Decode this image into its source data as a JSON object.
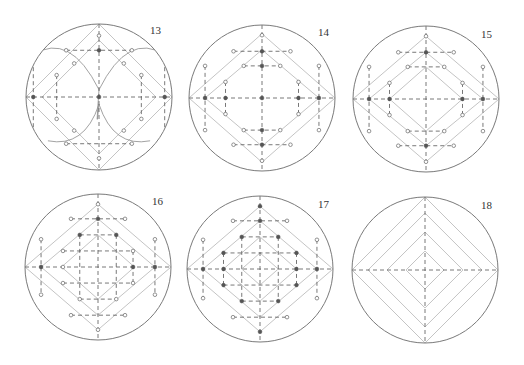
{
  "figure": {
    "width": 524,
    "height": 365,
    "colors": {
      "circle": "#7a7a7a",
      "dashed": "#555555",
      "diamond": "#c4c4c4",
      "arc": "#8a8a8a",
      "dot_filled": "#555555",
      "dot_open_stroke": "#666666",
      "dot_open_fill": "#ffffff",
      "label": "#333333"
    },
    "radius": 73,
    "panels": [
      {
        "id": "13",
        "label": "13",
        "center": [
          99,
          97
        ],
        "label_pos": [
          150,
          24
        ],
        "diamonds": [
          [
            100,
            100
          ],
          [
            78,
            78
          ]
        ],
        "dashed_axes": true,
        "dashed_segments": [
          [
            [
              -45,
              -64
            ],
            [
              45,
              -64
            ]
          ],
          [
            [
              -45,
              64
            ],
            [
              45,
              64
            ]
          ],
          [
            [
              -90,
              -60
            ],
            [
              -90,
              60
            ]
          ],
          [
            [
              90,
              -60
            ],
            [
              90,
              60
            ]
          ],
          [
            [
              -58,
              -30
            ],
            [
              -58,
              30
            ]
          ],
          [
            [
              58,
              -30
            ],
            [
              58,
              30
            ]
          ]
        ],
        "arcs": [
          "M -90 -58 Q -40 -90 0 -10",
          "M 90 -58 Q 40 -90 0 -10",
          "M -70 60 Q -20 70 0 10",
          "M 70 60 Q 20 70 0 10",
          "M 0 -10 Q -5 60 0 10"
        ],
        "dots_filled": [
          [
            0,
            -64
          ],
          [
            -90,
            0
          ],
          [
            90,
            0
          ],
          [
            0,
            0
          ]
        ],
        "dots_open": [
          [
            0,
            -84
          ],
          [
            0,
            84
          ],
          [
            -45,
            -64
          ],
          [
            45,
            -64
          ],
          [
            -45,
            64
          ],
          [
            45,
            64
          ],
          [
            -90,
            -60
          ],
          [
            90,
            -60
          ],
          [
            -90,
            60
          ],
          [
            90,
            60
          ],
          [
            -58,
            -30
          ],
          [
            58,
            -30
          ],
          [
            -58,
            30
          ],
          [
            58,
            30
          ],
          [
            -34,
            -46
          ],
          [
            34,
            -46
          ],
          [
            -34,
            46
          ],
          [
            34,
            46
          ]
        ]
      },
      {
        "id": "14",
        "label": "14",
        "center": [
          262,
          98
        ],
        "label_pos": [
          318,
          26
        ],
        "diamonds": [
          [
            100,
            88
          ],
          [
            78,
            66
          ]
        ],
        "dashed_axes": true,
        "dashed_segments": [
          [
            [
              -39,
              -64
            ],
            [
              39,
              -64
            ]
          ],
          [
            [
              -25,
              -44
            ],
            [
              25,
              -44
            ]
          ],
          [
            [
              -39,
              64
            ],
            [
              39,
              64
            ]
          ],
          [
            [
              -25,
              44
            ],
            [
              25,
              44
            ]
          ],
          [
            [
              -78,
              -44
            ],
            [
              -78,
              44
            ]
          ],
          [
            [
              78,
              -44
            ],
            [
              78,
              44
            ]
          ],
          [
            [
              -50,
              -22
            ],
            [
              -50,
              22
            ]
          ],
          [
            [
              50,
              -22
            ],
            [
              50,
              22
            ]
          ]
        ],
        "arcs": [],
        "dots_filled": [
          [
            0,
            -64
          ],
          [
            0,
            -44
          ],
          [
            0,
            0
          ],
          [
            0,
            44
          ],
          [
            0,
            64
          ],
          [
            -78,
            0
          ],
          [
            78,
            0
          ],
          [
            -50,
            0
          ],
          [
            50,
            0
          ]
        ],
        "dots_open": [
          [
            0,
            -86
          ],
          [
            0,
            86
          ],
          [
            -39,
            -64
          ],
          [
            39,
            -64
          ],
          [
            -25,
            -44
          ],
          [
            25,
            -44
          ],
          [
            -39,
            64
          ],
          [
            39,
            64
          ],
          [
            -25,
            44
          ],
          [
            25,
            44
          ],
          [
            -78,
            -44
          ],
          [
            78,
            -44
          ],
          [
            -78,
            44
          ],
          [
            78,
            44
          ],
          [
            -50,
            -22
          ],
          [
            50,
            -22
          ],
          [
            -50,
            22
          ],
          [
            50,
            22
          ]
        ]
      },
      {
        "id": "15",
        "label": "15",
        "center": [
          426,
          99
        ],
        "label_pos": [
          481,
          28
        ],
        "diamonds": [
          [
            100,
            86
          ],
          [
            78,
            64
          ],
          [
            50,
            44
          ]
        ],
        "dashed_axes": true,
        "dashed_segments": [
          [
            [
              -38,
              -64
            ],
            [
              38,
              -64
            ]
          ],
          [
            [
              -25,
              -44
            ],
            [
              25,
              -44
            ]
          ],
          [
            [
              -38,
              64
            ],
            [
              38,
              64
            ]
          ],
          [
            [
              -25,
              44
            ],
            [
              25,
              44
            ]
          ],
          [
            [
              -78,
              -44
            ],
            [
              -78,
              44
            ]
          ],
          [
            [
              78,
              -44
            ],
            [
              78,
              44
            ]
          ],
          [
            [
              -50,
              -22
            ],
            [
              -50,
              22
            ]
          ],
          [
            [
              50,
              -22
            ],
            [
              50,
              22
            ]
          ]
        ],
        "arcs": [],
        "dots_filled": [
          [
            0,
            -64
          ],
          [
            0,
            64
          ],
          [
            -78,
            0
          ],
          [
            78,
            0
          ],
          [
            -50,
            0
          ],
          [
            50,
            0
          ]
        ],
        "dots_open": [
          [
            0,
            -86
          ],
          [
            0,
            86
          ],
          [
            -38,
            -64
          ],
          [
            38,
            -64
          ],
          [
            -25,
            -44
          ],
          [
            25,
            -44
          ],
          [
            -38,
            64
          ],
          [
            38,
            64
          ],
          [
            -25,
            44
          ],
          [
            25,
            44
          ],
          [
            -78,
            -44
          ],
          [
            78,
            -44
          ],
          [
            -78,
            44
          ],
          [
            78,
            44
          ],
          [
            -50,
            -22
          ],
          [
            50,
            -22
          ],
          [
            -50,
            22
          ],
          [
            50,
            22
          ]
        ]
      },
      {
        "id": "16",
        "label": "16",
        "center": [
          98,
          267
        ],
        "label_pos": [
          152,
          195
        ],
        "diamonds": [
          [
            100,
            86
          ],
          [
            78,
            66
          ],
          [
            50,
            44
          ]
        ],
        "dashed_axes": true,
        "dashed_segments": [
          [
            [
              -37,
              -66
            ],
            [
              37,
              -66
            ]
          ],
          [
            [
              -25,
              -44
            ],
            [
              25,
              -44
            ]
          ],
          [
            [
              -48,
              -22
            ],
            [
              48,
              -22
            ]
          ],
          [
            [
              -48,
              22
            ],
            [
              48,
              22
            ]
          ],
          [
            [
              -25,
              44
            ],
            [
              25,
              44
            ]
          ],
          [
            [
              -37,
              66
            ],
            [
              37,
              66
            ]
          ],
          [
            [
              -78,
              -38
            ],
            [
              -78,
              38
            ]
          ],
          [
            [
              78,
              -38
            ],
            [
              78,
              38
            ]
          ],
          [
            [
              -25,
              -44
            ],
            [
              -25,
              44
            ]
          ],
          [
            [
              25,
              -44
            ],
            [
              25,
              44
            ]
          ],
          [
            [
              48,
              -22
            ],
            [
              48,
              22
            ]
          ]
        ],
        "arcs": [],
        "dots_filled": [
          [
            0,
            -66
          ],
          [
            -78,
            0
          ],
          [
            78,
            0
          ],
          [
            48,
            0
          ],
          [
            -25,
            -44
          ],
          [
            25,
            -44
          ]
        ],
        "dots_open": [
          [
            0,
            -86
          ],
          [
            0,
            86
          ],
          [
            -37,
            -66
          ],
          [
            37,
            -66
          ],
          [
            -37,
            66
          ],
          [
            37,
            66
          ],
          [
            -78,
            -38
          ],
          [
            78,
            -38
          ],
          [
            -78,
            38
          ],
          [
            78,
            38
          ],
          [
            -48,
            -22
          ],
          [
            48,
            -22
          ],
          [
            -48,
            22
          ],
          [
            48,
            22
          ],
          [
            -48,
            0
          ],
          [
            -25,
            44
          ],
          [
            25,
            44
          ]
        ]
      },
      {
        "id": "17",
        "label": "17",
        "center": [
          260,
          269
        ],
        "label_pos": [
          318,
          198
        ],
        "diamonds": [
          [
            100,
            86
          ],
          [
            78,
            66
          ],
          [
            50,
            44
          ],
          [
            25,
            22
          ]
        ],
        "dashed_axes": true,
        "dashed_segments": [
          [
            [
              -37,
              -66
            ],
            [
              37,
              -66
            ]
          ],
          [
            [
              -25,
              -44
            ],
            [
              25,
              -44
            ]
          ],
          [
            [
              -50,
              -22
            ],
            [
              50,
              -22
            ]
          ],
          [
            [
              -50,
              22
            ],
            [
              50,
              22
            ]
          ],
          [
            [
              -25,
              44
            ],
            [
              25,
              44
            ]
          ],
          [
            [
              -37,
              66
            ],
            [
              37,
              66
            ]
          ],
          [
            [
              -78,
              -40
            ],
            [
              -78,
              40
            ]
          ],
          [
            [
              78,
              -40
            ],
            [
              78,
              40
            ]
          ],
          [
            [
              -50,
              -22
            ],
            [
              -50,
              22
            ]
          ],
          [
            [
              50,
              -22
            ],
            [
              50,
              22
            ]
          ],
          [
            [
              -25,
              -44
            ],
            [
              -25,
              44
            ]
          ],
          [
            [
              25,
              -44
            ],
            [
              25,
              44
            ]
          ]
        ],
        "arcs": [],
        "dots_filled": [
          [
            0,
            -86
          ],
          [
            0,
            -66
          ],
          [
            -78,
            0
          ],
          [
            78,
            0
          ],
          [
            -50,
            0
          ],
          [
            50,
            0
          ],
          [
            0,
            86
          ],
          [
            -50,
            -22
          ],
          [
            50,
            -22
          ],
          [
            -50,
            22
          ],
          [
            50,
            22
          ],
          [
            -25,
            -44
          ],
          [
            25,
            -44
          ],
          [
            -25,
            44
          ],
          [
            25,
            44
          ]
        ],
        "dots_open": [
          [
            -37,
            -66
          ],
          [
            37,
            -66
          ],
          [
            -37,
            66
          ],
          [
            37,
            66
          ],
          [
            -78,
            -40
          ],
          [
            78,
            -40
          ],
          [
            -78,
            40
          ],
          [
            78,
            40
          ]
        ]
      },
      {
        "id": "18",
        "label": "18",
        "center": [
          425,
          270
        ],
        "label_pos": [
          481,
          199
        ],
        "diamonds": [
          [
            100,
            100
          ],
          [
            78,
            78
          ],
          [
            52,
            52
          ],
          [
            26,
            26
          ]
        ],
        "dashed_axes": true,
        "dashed_segments": [],
        "arcs": [],
        "dots_filled": [],
        "dots_open": []
      }
    ]
  }
}
